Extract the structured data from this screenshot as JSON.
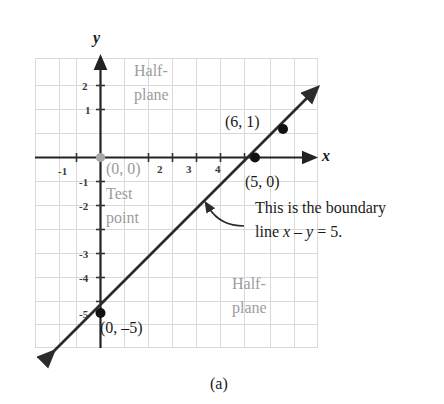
{
  "figure": {
    "caption": "(a)",
    "axis_labels": {
      "x": "x",
      "y": "y"
    },
    "colors": {
      "grid": "#d9d9d9",
      "axis": "#222222",
      "line": "#2b2b2b",
      "point": "#111111",
      "test_point": "#a6a6a6",
      "annotation_text": "#1a1a1a",
      "region_text": "#9d9d9d",
      "background": "#ffffff"
    },
    "x_ticks": [
      {
        "label": "-1",
        "value": -1
      },
      {
        "label": "2",
        "value": 2
      },
      {
        "label": "3",
        "value": 3
      },
      {
        "label": "4",
        "value": 4
      }
    ],
    "y_ticks": [
      {
        "label": "2",
        "value": 2
      },
      {
        "label": "1",
        "value": 1
      },
      {
        "label": "-1",
        "value": -1
      },
      {
        "label": "-2",
        "value": -2
      },
      {
        "label": "-3",
        "value": -3
      },
      {
        "label": "-4",
        "value": -4
      },
      {
        "label": "-5",
        "value": -5
      }
    ],
    "points": [
      {
        "name": "test-point",
        "label": "(0, 0)",
        "x": 0,
        "y": 0,
        "style": "gray-filled"
      },
      {
        "name": "intercept-x",
        "label": "(5, 0)",
        "x": 5,
        "y": 0,
        "style": "black-filled"
      },
      {
        "name": "point-on-line",
        "label": "(6, 1)",
        "x": 6,
        "y": 1,
        "style": "black-filled"
      },
      {
        "name": "intercept-y",
        "label": "(0, –5)",
        "x": 0,
        "y": -5,
        "style": "black-filled"
      }
    ],
    "regions": [
      {
        "name": "upper-half-plane",
        "line1": "Half-",
        "line2": "plane"
      },
      {
        "name": "lower-half-plane",
        "line1": "Half-",
        "line2": "plane"
      }
    ],
    "test_point_caption": {
      "line1": "Test",
      "line2": "point"
    },
    "boundary_note": {
      "line1": "This is the boundary",
      "line2_prefix": "line ",
      "line2_x": "x",
      "line2_minus": " – ",
      "line2_y": "y",
      "line2_suffix": " = 5."
    },
    "boundary_equation": "x - y = 5",
    "line": {
      "slope": 1,
      "intercept": -5,
      "style": "solid",
      "arrows": "both"
    }
  }
}
